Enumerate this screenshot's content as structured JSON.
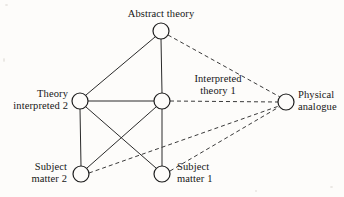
{
  "figure": {
    "type": "node-link-diagram",
    "background_color": "#fdfcfa",
    "ink_color": "#1d1d1d",
    "nodes": [
      {
        "id": "abstract_theory",
        "label_line1": "Abstract theory",
        "label_line2": "",
        "cx": 161,
        "cy": 31,
        "r": 8
      },
      {
        "id": "theory_interpreted_2",
        "label_line1": "Theory",
        "label_line2": "interpreted 2",
        "cx": 80,
        "cy": 101,
        "r": 8
      },
      {
        "id": "interpreted_theory_1",
        "label_line1": "Interpreted",
        "label_line2": "theory 1",
        "cx": 162,
        "cy": 101,
        "r": 8
      },
      {
        "id": "physical_analogue",
        "label_line1": "Physical",
        "label_line2": "analogue",
        "cx": 286,
        "cy": 102,
        "r": 8
      },
      {
        "id": "subject_matter_2",
        "label_line1": "Subject",
        "label_line2": "matter 2",
        "cx": 81,
        "cy": 174,
        "r": 8
      },
      {
        "id": "subject_matter_1",
        "label_line1": "Subject",
        "label_line2": "matter 1",
        "cx": 162,
        "cy": 174,
        "r": 8
      }
    ],
    "edges": [
      {
        "from": "abstract_theory",
        "to": "theory_interpreted_2",
        "style": "solid"
      },
      {
        "from": "abstract_theory",
        "to": "interpreted_theory_1",
        "style": "solid"
      },
      {
        "from": "theory_interpreted_2",
        "to": "interpreted_theory_1",
        "style": "solid"
      },
      {
        "from": "theory_interpreted_2",
        "to": "subject_matter_2",
        "style": "solid"
      },
      {
        "from": "theory_interpreted_2",
        "to": "subject_matter_1",
        "style": "solid"
      },
      {
        "from": "interpreted_theory_1",
        "to": "subject_matter_1",
        "style": "solid"
      },
      {
        "from": "interpreted_theory_1",
        "to": "subject_matter_2",
        "style": "solid"
      },
      {
        "from": "abstract_theory",
        "to": "physical_analogue",
        "style": "dashed"
      },
      {
        "from": "interpreted_theory_1",
        "to": "physical_analogue",
        "style": "dashed"
      },
      {
        "from": "subject_matter_1",
        "to": "physical_analogue",
        "style": "dashed"
      },
      {
        "from": "subject_matter_2",
        "to": "physical_analogue",
        "style": "dashed"
      }
    ],
    "labels": {
      "abstract_theory": "Abstract theory",
      "theory_interpreted_2_l1": "Theory",
      "theory_interpreted_2_l2": "interpreted 2",
      "interpreted_theory_1_l1": "Interpreted",
      "interpreted_theory_1_l2": "theory 1",
      "physical_analogue_l1": "Physical",
      "physical_analogue_l2": "analogue",
      "subject_matter_2_l1": "Subject",
      "subject_matter_2_l2": "matter 2",
      "subject_matter_1_l1": "Subject",
      "subject_matter_1_l2": "matter 1"
    }
  }
}
